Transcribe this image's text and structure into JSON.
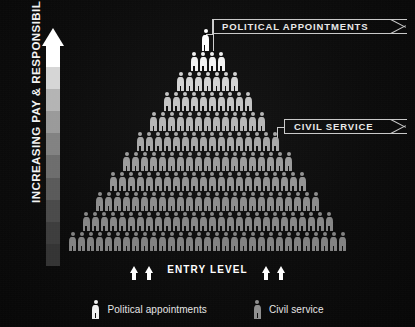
{
  "axis": {
    "label": "INCREASING PAY & RESPONSIBILITY",
    "arrow_icon": "up-arrow-icon",
    "gradient_stops": [
      "#ffffff",
      "#d6d6d6",
      "#b4b4b4",
      "#9a9a9a",
      "#828282",
      "#6d6d6d",
      "#5a5a5a",
      "#4a4a4a",
      "#3d3d3d",
      "#343434"
    ]
  },
  "banners": {
    "political": {
      "label": "POLITICAL APPOINTMENTS",
      "border_color": "#c9c9c9"
    },
    "civil": {
      "label": "CIVIL SERVICE",
      "border_color": "#c9c9c9"
    }
  },
  "entry": {
    "label": "ENTRY LEVEL",
    "arrow_icon": "up-arrow-icon",
    "arrows_left": 2,
    "arrows_right": 2
  },
  "legend": {
    "items": [
      {
        "label": "Political appointments",
        "color": "#f0f0f0",
        "icon": "person-icon"
      },
      {
        "label": "Civil service",
        "color": "#8f8f8f",
        "icon": "person-icon"
      }
    ]
  },
  "chart_data": {
    "type": "bar",
    "xlabel": "",
    "ylabel": "INCREASING PAY & RESPONSIBILITY",
    "grid": false,
    "legend_position": "bottom",
    "unit": "one icon = one position",
    "categories": [
      "Row 1 (top)",
      "Row 2",
      "Row 3",
      "Row 4",
      "Row 5",
      "Row 6",
      "Row 7",
      "Row 8",
      "Row 9",
      "Row 10",
      "Row 11 (entry level)"
    ],
    "values": [
      1,
      4,
      7,
      10,
      13,
      16,
      19,
      22,
      25,
      28,
      31
    ],
    "series": [
      {
        "name": "Political appointments",
        "values": [
          1,
          4,
          0,
          0,
          0,
          0,
          0,
          0,
          0,
          0,
          0
        ]
      },
      {
        "name": "Civil service",
        "values": [
          0,
          0,
          7,
          10,
          13,
          16,
          19,
          22,
          25,
          28,
          31
        ]
      }
    ],
    "rows": [
      {
        "count": 1,
        "group": "Political appointments",
        "color": "#ffffff",
        "leader": true
      },
      {
        "count": 4,
        "group": "Political appointments",
        "color": "#f2f2f2"
      },
      {
        "count": 7,
        "group": "Civil service",
        "color": "#d4d4d4"
      },
      {
        "count": 10,
        "group": "Civil service",
        "color": "#c4c4c4"
      },
      {
        "count": 13,
        "group": "Civil service",
        "color": "#b6b6b6"
      },
      {
        "count": 16,
        "group": "Civil service",
        "color": "#a8a8a8"
      },
      {
        "count": 19,
        "group": "Civil service",
        "color": "#9c9c9c"
      },
      {
        "count": 22,
        "group": "Civil service",
        "color": "#949494"
      },
      {
        "count": 25,
        "group": "Civil service",
        "color": "#8d8d8d"
      },
      {
        "count": 28,
        "group": "Civil service",
        "color": "#878787"
      },
      {
        "count": 31,
        "group": "Civil service",
        "color": "#828282"
      }
    ],
    "annotations": [
      {
        "text": "POLITICAL APPOINTMENTS",
        "target_row": 1
      },
      {
        "text": "CIVIL SERVICE",
        "target_row": 5
      },
      {
        "text": "ENTRY LEVEL",
        "target_row": 11
      }
    ]
  }
}
